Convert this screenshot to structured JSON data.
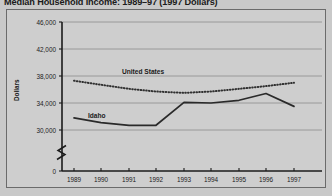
{
  "chart_data": {
    "type": "line",
    "title": "Median Household Income: 1989–97 (1997 Dollars)",
    "xlabel": "",
    "ylabel": "Dollars",
    "x": [
      1989,
      1990,
      1991,
      1992,
      1993,
      1994,
      1995,
      1996,
      1997
    ],
    "categories": [
      "1989",
      "1990",
      "1991",
      "1992",
      "1993",
      "1994",
      "1995",
      "1996",
      "1997"
    ],
    "series": [
      {
        "name": "United States",
        "style": "dotted",
        "values": [
          37300,
          36700,
          36100,
          35700,
          35500,
          35700,
          36100,
          36500,
          37000
        ]
      },
      {
        "name": "Idaho",
        "style": "solid",
        "values": [
          31800,
          31100,
          30700,
          30700,
          34100,
          34000,
          34400,
          35400,
          33500
        ]
      }
    ],
    "ylim": [
      30000,
      46000
    ],
    "yticks": [
      46000,
      42000,
      38000,
      34000,
      30000,
      0
    ],
    "ytick_labels": [
      "46,000",
      "42,000",
      "38,000",
      "34,000",
      "30,000",
      "0"
    ],
    "axis_break": true,
    "grid": true,
    "grid_axis": "y",
    "legend_position": "inline",
    "colors": {
      "page_background": "#c9c9c9",
      "plot_background": "#cecece",
      "frame": "#6b6b6b",
      "gridline": "#8d8d8d",
      "axis": "#1b1b1b",
      "united_states_line": "#303030",
      "idaho_line": "#2a2a2a",
      "text": "#1b1b1b"
    }
  },
  "ytick_positions": {
    "t46000": 22,
    "t42000": 49,
    "t38000": 76,
    "t34000": 103,
    "t30000": 130,
    "t0": 171
  },
  "xtick_positions": {
    "x1989": 74,
    "x1990": 101,
    "x1991": 129,
    "x1992": 156,
    "x1993": 184,
    "x1994": 211,
    "x1995": 239,
    "x1996": 266,
    "x1997": 294
  },
  "inline_labels": {
    "united_states": "United States",
    "idaho": "Idaho"
  }
}
